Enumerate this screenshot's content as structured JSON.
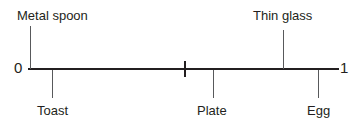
{
  "figure": {
    "type": "number-line",
    "title": "",
    "axis": {
      "start_label": "0",
      "end_label": "1",
      "start_value": 0,
      "end_value": 1,
      "midpoint_tick": true,
      "midpoint_value": 0.5,
      "color": "#231f20"
    },
    "items_above": [
      {
        "label": "Metal spoon",
        "value": 0.01
      },
      {
        "label": "Thin glass",
        "value": 0.82
      }
    ],
    "items_below": [
      {
        "label": "Toast",
        "value": 0.08
      },
      {
        "label": "Plate",
        "value": 0.6
      },
      {
        "label": "Egg",
        "value": 0.93
      }
    ]
  },
  "chart_data": {
    "type": "scatter",
    "title": "",
    "xlabel": "",
    "ylabel": "",
    "xlim": [
      0,
      1
    ],
    "grid": false,
    "legend": "none",
    "tick_labels": [
      "0",
      "1"
    ],
    "ticks": [
      0,
      0.5,
      1
    ],
    "categories": [
      "Metal spoon",
      "Toast",
      "Plate",
      "Thin glass",
      "Egg"
    ],
    "values": [
      0.01,
      0.08,
      0.6,
      0.82,
      0.93
    ],
    "annotations": [
      {
        "text": "Metal spoon",
        "x": 0.01,
        "position": "above"
      },
      {
        "text": "Toast",
        "x": 0.08,
        "position": "below"
      },
      {
        "text": "Plate",
        "x": 0.6,
        "position": "below"
      },
      {
        "text": "Thin glass",
        "x": 0.82,
        "position": "above"
      },
      {
        "text": "Egg",
        "x": 0.93,
        "position": "below"
      }
    ]
  }
}
